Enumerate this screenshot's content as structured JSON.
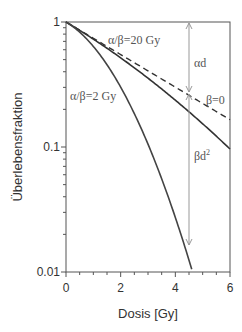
{
  "chart_data": {
    "type": "line",
    "title": "",
    "xlabel": "Dosis [Gy]",
    "ylabel": "Überlebensfraktion",
    "xlim": [
      0,
      6
    ],
    "ylim": [
      0.01,
      1
    ],
    "yscale": "log",
    "xticks": [
      0,
      2,
      4,
      6
    ],
    "xtick_labels": [
      "0",
      "2",
      "4",
      "6"
    ],
    "yticks": [
      0.01,
      0.1,
      1
    ],
    "ytick_labels": [
      "0.01",
      "0.1",
      "1"
    ],
    "grid": false,
    "model": "S = exp(-alpha*d - beta*d^2), alpha ≈ 0.3 Gy^-1",
    "series": [
      {
        "name": "α/β=20 Gy",
        "style": "solid",
        "x": [
          0,
          1,
          2,
          3,
          4,
          5,
          6
        ],
        "values": [
          1.0,
          0.73,
          0.52,
          0.35,
          0.23,
          0.15,
          0.097
        ]
      },
      {
        "name": "β=0",
        "style": "dashed",
        "x": [
          0,
          1,
          2,
          3,
          4,
          5,
          6
        ],
        "values": [
          1.0,
          0.74,
          0.55,
          0.41,
          0.3,
          0.22,
          0.165
        ]
      },
      {
        "name": "α/β=2 Gy",
        "style": "solid",
        "x": [
          0,
          1,
          2,
          3,
          4,
          4.65
        ],
        "values": [
          1.0,
          0.64,
          0.3,
          0.105,
          0.027,
          0.01
        ]
      }
    ],
    "annotations": [
      {
        "text": "α/β=20 Gy",
        "x": 2.2,
        "y": 0.8
      },
      {
        "text": "α/β=2 Gy",
        "x": 0.2,
        "y": 0.36
      },
      {
        "text": "β=0",
        "x": 5.0,
        "y": 0.23
      },
      {
        "text": "αd",
        "x": 4.6,
        "y": 0.5,
        "arrow": "double-headed, d=4.5, from 1 to 0.26"
      },
      {
        "text": "βd²",
        "x": 4.6,
        "y": 0.06,
        "arrow": "double-headed, d=4.5, from 0.26 to 0.016"
      }
    ]
  },
  "labels": {
    "xlabel": "Dosis [Gy]",
    "ylabel": "Überlebensfraktion",
    "series_ab20": "α/β=20 Gy",
    "series_ab2": "α/β=2 Gy",
    "series_beta0": "β=0",
    "alpha_d": "αd",
    "beta_d2": "βd"
  }
}
